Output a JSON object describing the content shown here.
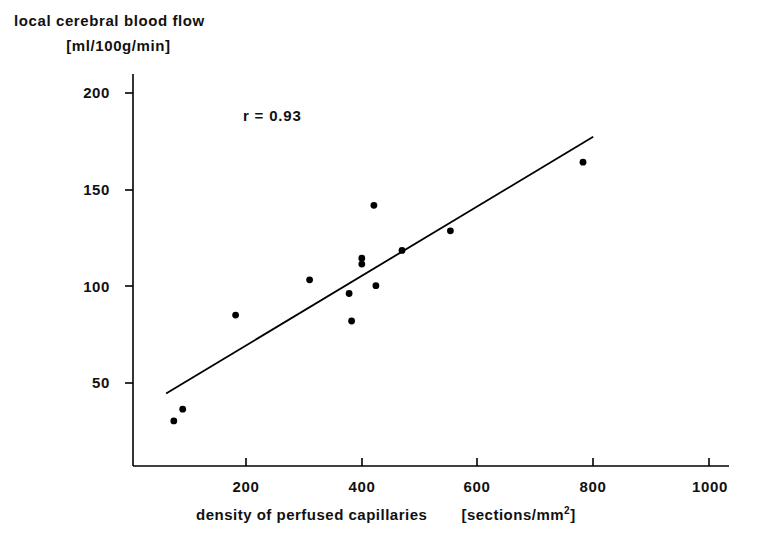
{
  "chart_data": {
    "type": "scatter",
    "title": "",
    "ylabel_line1": "local  cerebral  blood  flow",
    "ylabel_line2": "[ml/100g/min]",
    "xlabel": "density of perfused capillaries",
    "xlabel_unit": "[sections/mm",
    "xlabel_unit_sup": "2",
    "xlabel_unit_close": "]",
    "annotation": "r = 0.93",
    "xlim": [
      100,
      1035
    ],
    "ylim": [
      10,
      210
    ],
    "grid": false,
    "legend": null,
    "xticks": [
      200,
      400,
      600,
      800,
      1000
    ],
    "xtick_labels": [
      "200",
      "400",
      "600",
      "800",
      "1000"
    ],
    "yticks": [
      50,
      100,
      150,
      200
    ],
    "ytick_labels": [
      "50",
      "100",
      "150",
      "200"
    ],
    "x": [
      164,
      178,
      261,
      377,
      439,
      443,
      459,
      459,
      478,
      481,
      522,
      598,
      806
    ],
    "y": [
      33,
      39,
      87,
      105,
      98,
      84,
      116,
      113,
      143,
      102,
      120,
      130,
      165
    ],
    "points": [
      {
        "x": 164,
        "y": 33
      },
      {
        "x": 178,
        "y": 39
      },
      {
        "x": 261,
        "y": 87
      },
      {
        "x": 377,
        "y": 105
      },
      {
        "x": 439,
        "y": 98
      },
      {
        "x": 443,
        "y": 84
      },
      {
        "x": 459,
        "y": 116
      },
      {
        "x": 459,
        "y": 113
      },
      {
        "x": 478,
        "y": 143
      },
      {
        "x": 481,
        "y": 102
      },
      {
        "x": 522,
        "y": 120
      },
      {
        "x": 598,
        "y": 130
      },
      {
        "x": 806,
        "y": 165
      }
    ],
    "fit_line": {
      "x0": 152,
      "y0": 47,
      "x1": 822,
      "y1": 178
    },
    "marker": "filled-circle",
    "marker_color": "#000000",
    "line_color": "#000000",
    "axis_color": "#000000"
  }
}
